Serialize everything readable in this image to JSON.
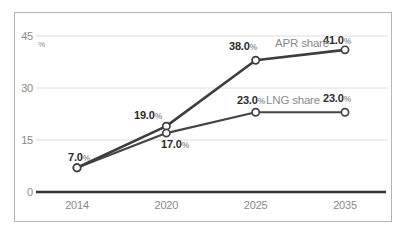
{
  "chart_data": {
    "type": "line",
    "title": "",
    "unit": "%",
    "categories": [
      "2014",
      "2020",
      "2025",
      "2035"
    ],
    "yticks": [
      0,
      15,
      30,
      45
    ],
    "ylim": [
      0,
      45
    ],
    "grid": true,
    "legend_position": "inline",
    "series": [
      {
        "name": "APR share",
        "values": [
          7.0,
          19.0,
          38.0,
          41.0
        ],
        "labels": [
          "7.0",
          "19.0",
          "38.0",
          "41.0"
        ],
        "color": "#3d3d3d"
      },
      {
        "name": "LNG share",
        "values": [
          7.0,
          17.0,
          23.0,
          23.0
        ],
        "labels": [
          "",
          "17.0",
          "23.0",
          "23.0"
        ],
        "color": "#454545"
      }
    ]
  },
  "colors": {
    "background": "#ffffff",
    "frame_border": "#b5b5b5",
    "grid": "#dcdcdc",
    "axis": "#333333",
    "tick_text": "#8a8a8a",
    "label_text": "#2b2b2b",
    "label_unit": "#9a9a9a",
    "series_label": "#8a8a8a",
    "marker_fill": "#ffffff"
  }
}
